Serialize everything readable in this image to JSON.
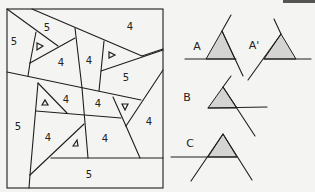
{
  "figure": {
    "left_panel": {
      "description": "Polygonal region tiling with cell labels",
      "cells": [
        {
          "label": "5",
          "x": 14,
          "y": 42
        },
        {
          "label": "5",
          "x": 47,
          "y": 28
        },
        {
          "label": "4",
          "x": 130,
          "y": 27
        },
        {
          "label": "4",
          "x": 61,
          "y": 63
        },
        {
          "label": "4",
          "x": 89,
          "y": 61
        },
        {
          "label": "5",
          "x": 126,
          "y": 78
        },
        {
          "label": "4",
          "x": 66,
          "y": 100
        },
        {
          "label": "4",
          "x": 98,
          "y": 104
        },
        {
          "label": "5",
          "x": 18,
          "y": 127
        },
        {
          "label": "4",
          "x": 48,
          "y": 138
        },
        {
          "label": "4",
          "x": 105,
          "y": 139
        },
        {
          "label": "4",
          "x": 149,
          "y": 122
        },
        {
          "label": "5",
          "x": 89,
          "y": 175
        }
      ],
      "triangle_markers": [
        {
          "x": 40,
          "y": 47,
          "dir": "right"
        },
        {
          "x": 112,
          "y": 55,
          "dir": "right"
        },
        {
          "x": 45,
          "y": 103,
          "dir": "up"
        },
        {
          "x": 125,
          "y": 107,
          "dir": "down"
        },
        {
          "x": 76,
          "y": 143,
          "dir": "up"
        }
      ]
    },
    "right_panel": {
      "diagrams": [
        {
          "label": "A"
        },
        {
          "label": "A'"
        },
        {
          "label": "B"
        },
        {
          "label": "C"
        }
      ]
    }
  }
}
